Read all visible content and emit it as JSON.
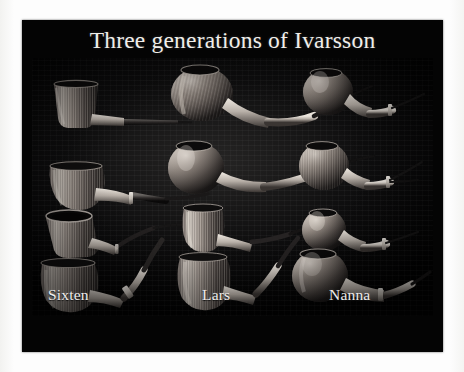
{
  "slide": {
    "title": "Three generations of Ivarsson",
    "background_color": "#040404",
    "mat_color": "#fdfdfd",
    "photo_background_color": "#0b0b0c",
    "text_color": "#f0eeea"
  },
  "columns": [
    {
      "maker": "Sixten",
      "label_position": "bottom-left",
      "pipes": [
        {
          "row": 1,
          "shape": "billiard",
          "bowl": "straight-tapered",
          "grain": "vertical-striated",
          "stem": "straight-slender"
        },
        {
          "row": 2,
          "shape": "billiard-bent",
          "bowl": "upright-rounded",
          "grain": "vertical-striated",
          "stem": "gently-bent-slender"
        },
        {
          "row": 3,
          "shape": "dublin-tilted",
          "bowl": "flared-rim-visible",
          "grain": "vertical-striated",
          "stem": "long-curved"
        },
        {
          "row": 4,
          "shape": "bent-billiard-banded",
          "bowl": "rounded-bent",
          "grain": "vertical-striated",
          "stem": "curved-with-silver-band"
        }
      ]
    },
    {
      "maker": "Lars",
      "label_position": "bottom-center",
      "pipes": [
        {
          "row": 1,
          "shape": "apple-bent",
          "bowl": "large-round",
          "grain": "radial-flame",
          "stem": "long-sweeping-bent"
        },
        {
          "row": 2,
          "shape": "apple-bent",
          "bowl": "round-polished",
          "grain": "mottled",
          "stem": "long-bent-tapered"
        },
        {
          "row": 3,
          "shape": "billiard",
          "bowl": "upright-barrel",
          "grain": "vertical-striated",
          "stem": "straight-slender"
        },
        {
          "row": 4,
          "shape": "bent-billiard",
          "bowl": "upright-tapered",
          "grain": "vertical-striated",
          "stem": "short-bent"
        }
      ]
    },
    {
      "maker": "Nanna",
      "label_position": "bottom-right",
      "pipes": [
        {
          "row": 1,
          "shape": "apple-bent",
          "bowl": "round-smooth",
          "grain": "polished-smooth",
          "stem": "short-shank-thin-stem"
        },
        {
          "row": 2,
          "shape": "apple-bent",
          "bowl": "round-smooth",
          "grain": "vertical-striated",
          "stem": "short-shank-thin-stem"
        },
        {
          "row": 3,
          "shape": "apple",
          "bowl": "round-compact",
          "grain": "smooth",
          "stem": "short-bright-shank"
        },
        {
          "row": 4,
          "shape": "bent-apple-banded",
          "bowl": "round-large",
          "grain": "smooth-highlight",
          "stem": "long-bent-with-band"
        }
      ]
    }
  ],
  "summary": {
    "pipe_count": 12,
    "rows": 4,
    "columns": 3
  }
}
